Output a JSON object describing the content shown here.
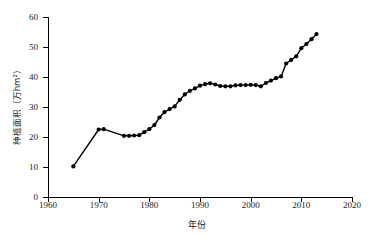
{
  "chart_data": {
    "type": "line",
    "title": "",
    "xlabel": "年份",
    "ylabel": "种植面积（万hm²）",
    "xlim": [
      1960,
      2020
    ],
    "ylim": [
      0,
      60
    ],
    "xticks": [
      1960,
      1970,
      1980,
      1990,
      2000,
      2010,
      2020
    ],
    "yticks": [
      0,
      10,
      20,
      30,
      40,
      50,
      60
    ],
    "grid": false,
    "legend": "none",
    "marker": "filled-circle",
    "series": [
      {
        "name": "种植面积",
        "x": [
          1965,
          1970,
          1971,
          1975,
          1976,
          1977,
          1978,
          1979,
          1980,
          1981,
          1982,
          1983,
          1984,
          1985,
          1986,
          1987,
          1988,
          1989,
          1990,
          1991,
          1992,
          1993,
          1994,
          1995,
          1996,
          1997,
          1998,
          1999,
          2000,
          2001,
          2002,
          2003,
          2004,
          2005,
          2006,
          2007,
          2008,
          2009,
          2010,
          2011,
          2012,
          2013
        ],
        "values": [
          10.2,
          22.5,
          22.6,
          20.4,
          20.4,
          20.5,
          20.6,
          21.6,
          22.6,
          24.0,
          26.5,
          28.3,
          29.3,
          30.2,
          32.4,
          34.2,
          35.4,
          36.2,
          37.1,
          37.6,
          37.9,
          37.5,
          37.0,
          36.9,
          36.9,
          37.2,
          37.3,
          37.3,
          37.4,
          37.3,
          36.9,
          38.0,
          38.8,
          39.6,
          40.2,
          44.5,
          45.7,
          46.9,
          49.6,
          51.0,
          52.6,
          54.3
        ]
      }
    ]
  }
}
